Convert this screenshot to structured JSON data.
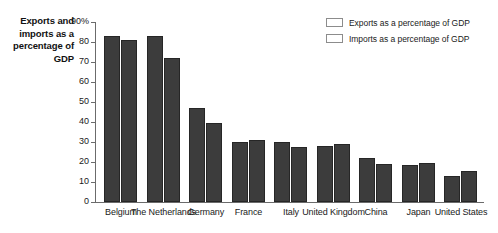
{
  "chart_data": {
    "type": "bar",
    "title": "Exports and imports as a percentage of GDP",
    "xlabel": "",
    "ylabel": "",
    "ylim": [
      0,
      90
    ],
    "ytick_labels": [
      "90%",
      "80",
      "70",
      "60",
      "50",
      "40",
      "30",
      "20",
      "10",
      "0"
    ],
    "ytick_values": [
      90,
      80,
      70,
      60,
      50,
      40,
      30,
      20,
      10,
      0
    ],
    "grid": false,
    "legend_position": "top-right",
    "categories": [
      "Belgium",
      "The Netherlands",
      "Germany",
      "France",
      "Italy",
      "United Kingdom",
      "China",
      "Japan",
      "United States"
    ],
    "series": [
      {
        "name": "Exports as a percentage of GDP",
        "color": "#3c3c3c",
        "values": [
          83,
          83,
          47,
          30,
          30,
          28,
          22,
          18.5,
          13
        ]
      },
      {
        "name": "Imports as a percentage of GDP",
        "color": "#3c3c3c",
        "values": [
          81,
          72,
          39.5,
          31,
          27.5,
          29,
          19,
          19.5,
          15.5
        ]
      }
    ]
  },
  "legend": {
    "items": [
      {
        "label": "Exports as a percentage of GDP",
        "color": "#3c3c3c"
      },
      {
        "label": "Imports as a percentage of GDP",
        "color": "#3c3c3c"
      }
    ]
  },
  "colors": {
    "bar_fill": "#3c3c3c",
    "bar_stroke": "#262626",
    "axis": "#6b6b6b",
    "text": "#1a1a1a",
    "background": "#ffffff"
  }
}
